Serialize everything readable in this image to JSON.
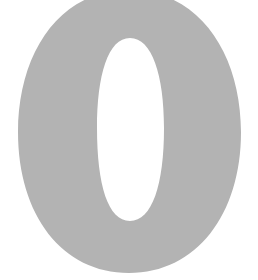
{
  "image": {
    "glyph": "0",
    "description": "Large gray numeral zero on white background",
    "colors": {
      "glyph": "#b3b3b3",
      "background": "#ffffff"
    }
  }
}
